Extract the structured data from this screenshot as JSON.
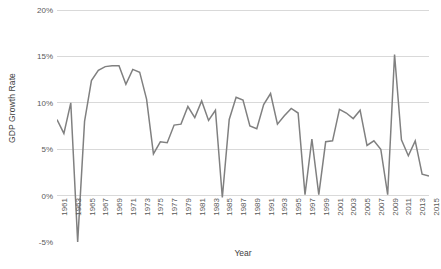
{
  "chart_data": {
    "type": "line",
    "title": "",
    "xlabel": "Year",
    "ylabel": "GDP Growth Rate",
    "ylim": [
      -5,
      20
    ],
    "xlim": [
      1961,
      2015
    ],
    "y_tick_labels": [
      "20%",
      "15%",
      "10%",
      "5%",
      "0%",
      "-5%"
    ],
    "y_ticks": [
      20,
      15,
      10,
      5,
      0,
      -5
    ],
    "y_tick_suffix": "%",
    "x_tick_labels": [
      "1961",
      "1963",
      "1965",
      "1967",
      "1969",
      "1971",
      "1973",
      "1975",
      "1977",
      "1979",
      "1981",
      "1983",
      "1985",
      "1987",
      "1989",
      "1991",
      "1993",
      "1995",
      "1997",
      "1999",
      "2001",
      "2003",
      "2005",
      "2007",
      "2009",
      "2011",
      "2013",
      "2015"
    ],
    "x_tick_step": 2,
    "grid": {
      "horizontal": true,
      "vertical": false
    },
    "legend": {
      "visible": false,
      "position": "none"
    },
    "series": [
      {
        "name": "GDP Growth Rate",
        "color": "#808080",
        "line_width": 1.5,
        "x": [
          1961,
          1962,
          1963,
          1964,
          1965,
          1966,
          1967,
          1968,
          1969,
          1970,
          1971,
          1972,
          1973,
          1974,
          1975,
          1976,
          1977,
          1978,
          1979,
          1980,
          1981,
          1982,
          1983,
          1984,
          1985,
          1986,
          1987,
          1988,
          1989,
          1990,
          1991,
          1992,
          1993,
          1994,
          1995,
          1996,
          1997,
          1998,
          1999,
          2000,
          2001,
          2002,
          2003,
          2004,
          2005,
          2006,
          2007,
          2008,
          2009,
          2010,
          2011,
          2012,
          2013,
          2014,
          2015
        ],
        "values": [
          8.2,
          6.7,
          10.0,
          -6.5,
          8.0,
          12.4,
          13.5,
          13.9,
          14.0,
          14.0,
          12.0,
          13.6,
          13.3,
          10.4,
          4.5,
          5.8,
          5.7,
          7.6,
          7.7,
          9.6,
          8.4,
          10.2,
          8.1,
          9.2,
          -0.2,
          8.2,
          10.6,
          10.3,
          7.5,
          7.2,
          9.8,
          11.0,
          7.7,
          8.6,
          9.4,
          8.9,
          0.1,
          6.1,
          0.1,
          5.8,
          5.9,
          9.3,
          8.9,
          8.3,
          9.2,
          5.4,
          5.9,
          5.0,
          0.1,
          15.2,
          6.0,
          4.3,
          5.9,
          2.3,
          2.1
        ]
      }
    ]
  },
  "styling": {
    "background": "#ffffff",
    "grid_color": "#d9d9d9",
    "axis_text_color": "#595959",
    "axis_title_color": "#404040",
    "line_color": "#808080"
  }
}
